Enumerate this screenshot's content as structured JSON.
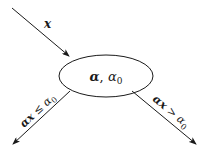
{
  "diagram": {
    "type": "decision-node",
    "node": {
      "label_main": "α",
      "label_sep": ", ",
      "label_threshold": "α",
      "label_threshold_sub": "0",
      "shape": "ellipse"
    },
    "input_edge": {
      "label": "x"
    },
    "left_edge": {
      "label_alpha": "α",
      "label_x": "x",
      "label_op": " ≤ ",
      "label_threshold": "α",
      "label_threshold_sub": "0"
    },
    "right_edge": {
      "label_alpha": "α",
      "label_x": "x",
      "label_op": " > ",
      "label_threshold": "α",
      "label_threshold_sub": "0"
    },
    "colors": {
      "stroke": "#1a1a1a",
      "background": "#ffffff"
    }
  }
}
